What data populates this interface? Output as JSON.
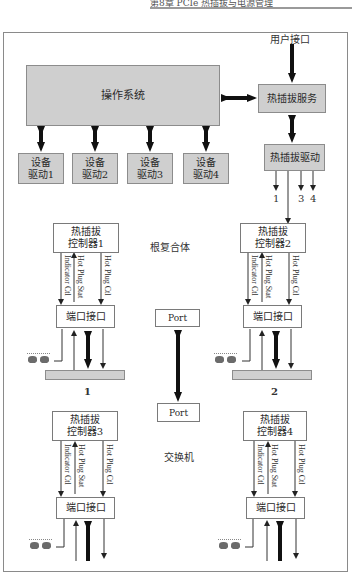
{
  "header": {
    "text": "第8章 PCIe 热插拔与电源管理"
  },
  "diagram": {
    "user_interface": "用户接口",
    "os": "操作系统",
    "hotplug_service": "热插拔服务",
    "hotplug_driver": "热插拔驱动",
    "device_drivers": [
      {
        "line1": "设备",
        "line2": "驱动1"
      },
      {
        "line1": "设备",
        "line2": "驱动2"
      },
      {
        "line1": "设备",
        "line2": "驱动3"
      },
      {
        "line1": "设备",
        "line2": "驱动4"
      }
    ],
    "driver_outputs": [
      "1",
      "3",
      "4"
    ],
    "root_complex": {
      "label": "根复合体",
      "port": "Port",
      "controllers": [
        {
          "line1": "热插拔",
          "line2": "控制器1"
        },
        {
          "line1": "热插拔",
          "line2": "控制器2"
        }
      ],
      "port_interface": "端口接口"
    },
    "switch": {
      "label": "交换机",
      "port": "Port",
      "controllers": [
        {
          "line1": "热插拔",
          "line2": "控制器3"
        },
        {
          "line1": "热插拔",
          "line2": "控制器4"
        }
      ],
      "port_interface": "端口接口"
    },
    "signals": {
      "indicator": "Indicator Ctl",
      "status": "Hot Plug Stat",
      "control": "Hot Plug Ctl"
    },
    "slots": [
      "1",
      "2"
    ]
  }
}
